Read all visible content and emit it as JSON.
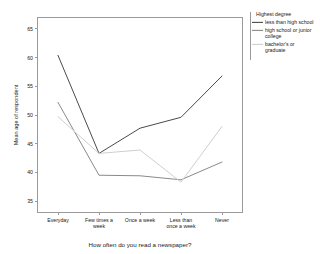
{
  "chart_data": {
    "type": "line",
    "title": "",
    "xlabel": "How often do you read a newspaper?",
    "ylabel": "Mean age of respondent",
    "categories": [
      "Everyday",
      "Few times a week",
      "Once a week",
      "Less than once a week",
      "Never"
    ],
    "ylim": [
      33,
      67
    ],
    "yticks": [
      35,
      40,
      45,
      50,
      55,
      60,
      65
    ],
    "ytick_labels": [
      "35",
      "40",
      "45",
      "50",
      "55",
      "60",
      "65"
    ],
    "grid": false,
    "legend_position": "right",
    "legend_title": "Highest degree",
    "series": [
      {
        "name": "less than high school",
        "color": "#4a4a4a",
        "values": [
          60.4,
          43.3,
          47.7,
          49.6,
          56.8
        ]
      },
      {
        "name": "high school or junior college",
        "color": "#8a8a8a",
        "values": [
          52.2,
          39.5,
          39.4,
          38.7,
          41.8
        ]
      },
      {
        "name": "bachelor's or graduate",
        "color": "#cfcfcf",
        "values": [
          49.7,
          43.3,
          43.9,
          38.3,
          48.0
        ]
      }
    ]
  },
  "axes": {
    "x_title": "How often do you read a newspaper?",
    "y_title": "Mean age of respondent",
    "category_labels": [
      [
        "Everyday"
      ],
      [
        "Few times a",
        "week"
      ],
      [
        "Once a week"
      ],
      [
        "Less than",
        "once a week"
      ],
      [
        "Never"
      ]
    ],
    "y_tick_labels": [
      "65",
      "60",
      "55",
      "50",
      "45",
      "40",
      "35"
    ]
  },
  "legend": {
    "title": "Highest degree",
    "items": [
      {
        "label_lines": [
          "less than high school"
        ],
        "color": "#4a4a4a"
      },
      {
        "label_lines": [
          "high school or junior",
          "college"
        ],
        "color": "#8a8a8a"
      },
      {
        "label_lines": [
          "bachelor's or",
          "graduate"
        ],
        "color": "#cfcfcf"
      }
    ]
  },
  "colors": {
    "frame": "#9a9a9a",
    "background": "#ffffff",
    "text": "#1a1a1a"
  }
}
